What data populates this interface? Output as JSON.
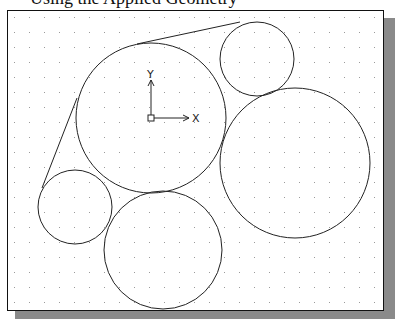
{
  "caption_fragment": "Using the Applied Geometry",
  "drawing": {
    "background": "#ffffff",
    "stroke": "#222222",
    "grid": {
      "spacing": 15,
      "origin_x": 14,
      "origin_y": 17,
      "dot_color": "#9a9a9a"
    },
    "ucs_icon": {
      "x_label": "X",
      "y_label": "Y",
      "origin": [
        151,
        118
      ]
    },
    "circles": [
      {
        "id": "center-large",
        "cx": 151,
        "cy": 118,
        "r": 75
      },
      {
        "id": "top-right-small",
        "cx": 257,
        "cy": 59,
        "r": 37
      },
      {
        "id": "right-large",
        "cx": 295,
        "cy": 163,
        "r": 75
      },
      {
        "id": "bottom-medium",
        "cx": 163,
        "cy": 250,
        "r": 59
      },
      {
        "id": "left-small",
        "cx": 75,
        "cy": 207,
        "r": 37
      }
    ],
    "lines": [
      {
        "id": "top-tangent",
        "x1": 137,
        "y1": 44,
        "x2": 240,
        "y2": 22
      },
      {
        "id": "left-tangent",
        "x1": 77,
        "y1": 98,
        "x2": 42,
        "y2": 188
      }
    ]
  }
}
